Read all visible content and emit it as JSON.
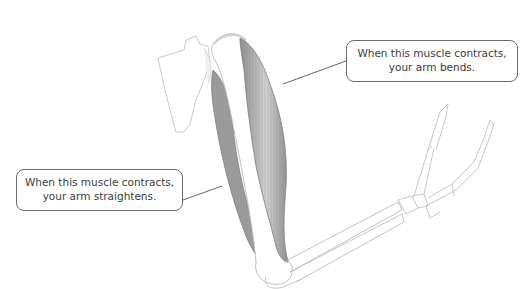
{
  "diagram": {
    "colors": {
      "muscle": "#9a9a9a",
      "muscle_highlight": "#cfcfcf",
      "bone_outline": "#b8b8b8",
      "leader_line": "#555555",
      "callout_border": "#6b6b6b",
      "callout_text": "#3c3c3c"
    },
    "labels": {
      "biceps": {
        "line1": "When this muscle contracts,",
        "line2": "your arm bends."
      },
      "triceps": {
        "line1": "When this muscle contracts,",
        "line2": "your arm straightens."
      }
    }
  }
}
